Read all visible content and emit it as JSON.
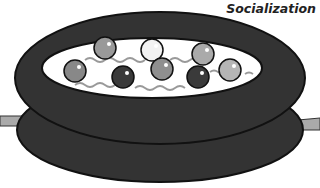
{
  "caption": "Socialization",
  "colors": {
    "ring_dark": "#333333",
    "ring_outline": "#111111",
    "interior": "#ffffff",
    "wave": "#999999",
    "side_bar": "#aaaaaa"
  },
  "balls": [
    {
      "cx": 105,
      "cy": 48,
      "r": 11,
      "fill": "#999999"
    },
    {
      "cx": 152,
      "cy": 50,
      "r": 11,
      "fill": "#f2f2f2"
    },
    {
      "cx": 203,
      "cy": 54,
      "r": 11,
      "fill": "#aaaaaa"
    },
    {
      "cx": 75,
      "cy": 71,
      "r": 11,
      "fill": "#888888"
    },
    {
      "cx": 123,
      "cy": 77,
      "r": 11,
      "fill": "#3a3a3a"
    },
    {
      "cx": 162,
      "cy": 69,
      "r": 11,
      "fill": "#8f8f8f"
    },
    {
      "cx": 198,
      "cy": 77,
      "r": 11,
      "fill": "#3a3a3a"
    },
    {
      "cx": 230,
      "cy": 70,
      "r": 11,
      "fill": "#b5b5b5"
    }
  ]
}
